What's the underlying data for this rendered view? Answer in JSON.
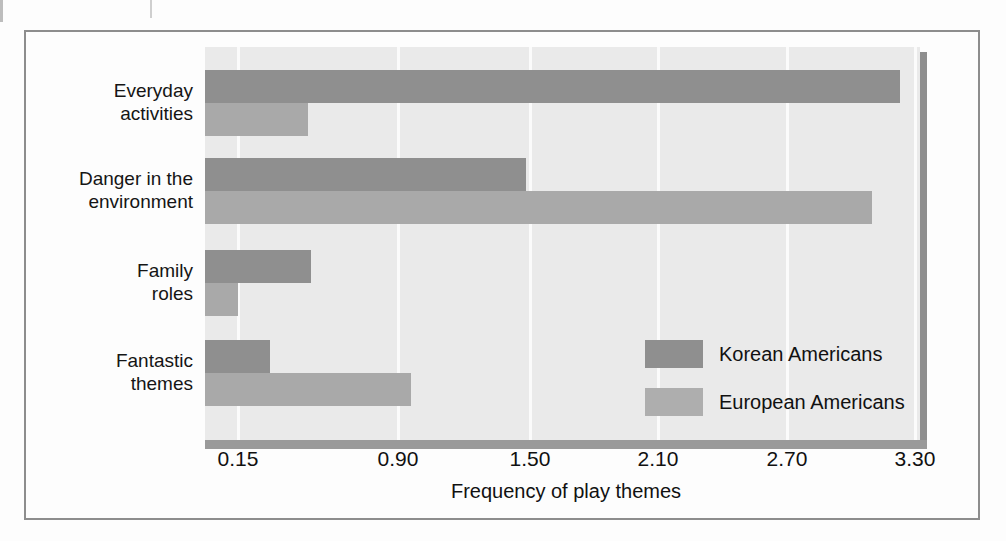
{
  "chart_data": {
    "type": "bar",
    "orientation": "horizontal",
    "title": "",
    "xlabel": "Frequency of play themes",
    "ylabel": "",
    "categories": [
      "Everyday activities",
      "Danger in the environment",
      "Family roles",
      "Fantastic themes"
    ],
    "tick_labels": [
      "0.15",
      "0.90",
      "1.50",
      "2.10",
      "2.70",
      "3.30"
    ],
    "tick_values": [
      0.15,
      0.9,
      1.5,
      2.1,
      2.7,
      3.3
    ],
    "xlim": [
      0.0,
      3.45
    ],
    "grid": true,
    "legend_position": "inside-lower-right",
    "series": [
      {
        "name": "Korean Americans",
        "color": "#8f8f8f",
        "values": [
          3.23,
          1.48,
          0.49,
          0.3
        ]
      },
      {
        "name": "European Americans",
        "color": "#a9a9a9",
        "values": [
          0.48,
          3.1,
          0.15,
          0.96
        ]
      }
    ]
  },
  "axis": {
    "title": "Frequency of play themes"
  },
  "categories": [
    {
      "line1": "Everyday",
      "line2": "activities"
    },
    {
      "line1": "Danger in the",
      "line2": "environment"
    },
    {
      "line1": "Family",
      "line2": "roles"
    },
    {
      "line1": "Fantastic",
      "line2": "themes"
    }
  ],
  "ticks": [
    {
      "label": "0.15"
    },
    {
      "label": "0.90"
    },
    {
      "label": "1.50"
    },
    {
      "label": "2.10"
    },
    {
      "label": "2.70"
    },
    {
      "label": "3.30"
    }
  ],
  "legend": [
    {
      "label": "Korean Americans"
    },
    {
      "label": "European Americans"
    }
  ]
}
